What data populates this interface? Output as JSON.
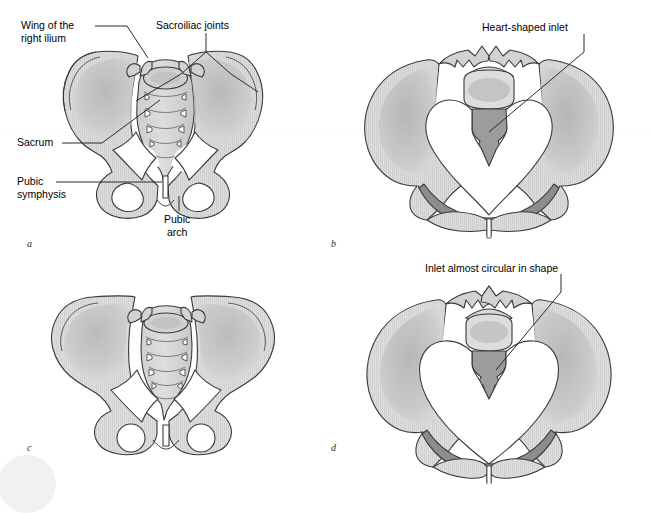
{
  "figure": {
    "panels": [
      {
        "letter": "a",
        "name": "male-pelvis-anterior"
      },
      {
        "letter": "b",
        "name": "male-pelvic-inlet"
      },
      {
        "letter": "c",
        "name": "female-pelvis-anterior"
      },
      {
        "letter": "d",
        "name": "female-pelvic-inlet"
      }
    ]
  },
  "labels": {
    "wing_of_ilium_line1": "Wing of the",
    "wing_of_ilium_line2": "right ilium",
    "sacroiliac_joints": "Sacroiliac joints",
    "sacrum": "Sacrum",
    "pubic_symphysis_line1": "Pubic",
    "pubic_symphysis_line2": "symphysis",
    "pubic_arch_line1": "Pubic",
    "pubic_arch_line2": "arch",
    "heart_shaped_inlet": "Heart-shaped inlet",
    "inlet_circular": "Inlet almost circular in shape"
  },
  "colors": {
    "bone_fill": "#d6d6d6",
    "bone_fill_light": "#e2e2e2",
    "bone_outline": "#3a3a3a",
    "shadow_mid": "#bdbdbd",
    "shadow_dark": "#8d8d8d",
    "inlet_white": "#ffffff",
    "text": "#000000",
    "leader": "#2b2b2b",
    "background": "#ffffff"
  }
}
